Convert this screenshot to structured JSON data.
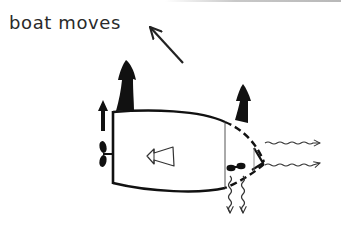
{
  "diagram": {
    "caption": "boat moves",
    "colors": {
      "ink": "#1a1a1a",
      "line": "#222222",
      "background": "#ffffff"
    },
    "elements": {
      "motion_arrow": {
        "direction": "up-left",
        "icon": "arrow-up-left-icon"
      },
      "hull": {
        "shape": "boat hull outline, stern on left, dashed bow on right"
      },
      "stern_thrust_arrow": {
        "icon": "filled-arrow-up-icon",
        "size": "large"
      },
      "stern_small_arrow": {
        "icon": "arrow-up-icon",
        "size": "small"
      },
      "stern_propeller": {
        "icon": "propeller-icon"
      },
      "bow_thrust_arrow": {
        "icon": "filled-arrow-up-icon",
        "size": "medium"
      },
      "bow_thruster_propeller": {
        "icon": "propeller-icon",
        "orientation": "horizontal"
      },
      "heading_arrow": {
        "icon": "hollow-arrow-left-icon"
      },
      "downward_jets": {
        "count": 2,
        "icon": "wavy-arrow-down-icon"
      },
      "forward_jets": {
        "count": 2,
        "icon": "wavy-arrow-right-icon"
      }
    }
  }
}
